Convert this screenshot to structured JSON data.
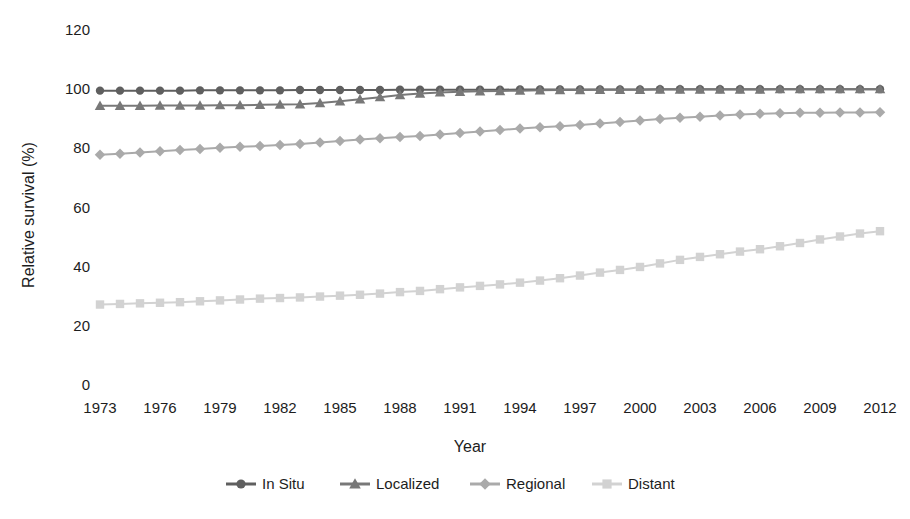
{
  "chart_data": {
    "type": "line",
    "title": "",
    "xlabel": "Year",
    "ylabel": "Relative survival (%)",
    "xlim": [
      1973,
      2012
    ],
    "ylim": [
      0,
      120
    ],
    "yticks": [
      0,
      20,
      40,
      60,
      80,
      100,
      120
    ],
    "ytick_labels": [
      "0",
      "20",
      "40",
      "60",
      "80",
      "100",
      "120"
    ],
    "xticks": [
      1973,
      1976,
      1979,
      1982,
      1985,
      1988,
      1991,
      1994,
      1997,
      2000,
      2003,
      2006,
      2009,
      2012
    ],
    "xtick_labels": [
      "1973",
      "1976",
      "1979",
      "1982",
      "1985",
      "1988",
      "1991",
      "1994",
      "1997",
      "2000",
      "2003",
      "2006",
      "2009",
      "2012"
    ],
    "grid": false,
    "legend_position": "bottom",
    "x": [
      1973,
      1974,
      1975,
      1976,
      1977,
      1978,
      1979,
      1980,
      1981,
      1982,
      1983,
      1984,
      1985,
      1986,
      1987,
      1988,
      1989,
      1990,
      1991,
      1992,
      1993,
      1994,
      1995,
      1996,
      1997,
      1998,
      1999,
      2000,
      2001,
      2002,
      2003,
      2004,
      2005,
      2006,
      2007,
      2008,
      2009,
      2010,
      2011,
      2012
    ],
    "series": [
      {
        "name": "In Situ",
        "color": "#5f5f5f",
        "marker": "circle",
        "values": [
          99.5,
          99.5,
          99.5,
          99.5,
          99.5,
          99.6,
          99.6,
          99.6,
          99.6,
          99.6,
          99.7,
          99.7,
          99.7,
          99.7,
          99.7,
          99.8,
          99.8,
          99.8,
          99.8,
          99.8,
          99.8,
          99.9,
          99.9,
          99.9,
          99.9,
          99.9,
          99.9,
          99.9,
          100.0,
          100.0,
          100.0,
          100.0,
          100.0,
          100.0,
          100.0,
          100.0,
          100.0,
          100.0,
          100.0,
          100.0
        ]
      },
      {
        "name": "Localized",
        "color": "#787878",
        "marker": "triangle",
        "values": [
          94.4,
          94.4,
          94.4,
          94.5,
          94.5,
          94.5,
          94.6,
          94.6,
          94.7,
          94.8,
          94.9,
          95.3,
          95.9,
          96.6,
          97.3,
          98.0,
          98.5,
          98.9,
          99.1,
          99.3,
          99.4,
          99.5,
          99.6,
          99.7,
          99.7,
          99.8,
          99.8,
          99.8,
          99.9,
          99.9,
          99.9,
          99.9,
          99.9,
          99.9,
          100.0,
          100.0,
          100.0,
          100.0,
          100.0,
          100.0
        ]
      },
      {
        "name": "Regional",
        "color": "#aaaaaa",
        "marker": "diamond",
        "values": [
          77.8,
          78.2,
          78.6,
          79.0,
          79.4,
          79.8,
          80.2,
          80.5,
          80.8,
          81.1,
          81.5,
          82.0,
          82.5,
          83.0,
          83.4,
          83.8,
          84.2,
          84.7,
          85.2,
          85.7,
          86.2,
          86.7,
          87.1,
          87.5,
          87.9,
          88.4,
          88.9,
          89.4,
          89.9,
          90.3,
          90.7,
          91.1,
          91.4,
          91.7,
          91.9,
          92.0,
          92.0,
          92.1,
          92.1,
          92.2
        ]
      },
      {
        "name": "Distant",
        "color": "#d2d2d2",
        "marker": "square",
        "values": [
          27.2,
          27.4,
          27.6,
          27.8,
          28.0,
          28.3,
          28.6,
          28.9,
          29.2,
          29.4,
          29.6,
          29.9,
          30.2,
          30.5,
          30.9,
          31.4,
          31.8,
          32.4,
          33.0,
          33.5,
          34.0,
          34.6,
          35.3,
          36.1,
          37.0,
          38.0,
          38.9,
          39.9,
          41.1,
          42.3,
          43.3,
          44.2,
          45.1,
          45.9,
          46.9,
          48.0,
          49.2,
          50.2,
          51.2,
          52.0
        ]
      }
    ]
  },
  "legend": {
    "items": [
      {
        "label": "In Situ"
      },
      {
        "label": "Localized"
      },
      {
        "label": "Regional"
      },
      {
        "label": "Distant"
      }
    ]
  }
}
